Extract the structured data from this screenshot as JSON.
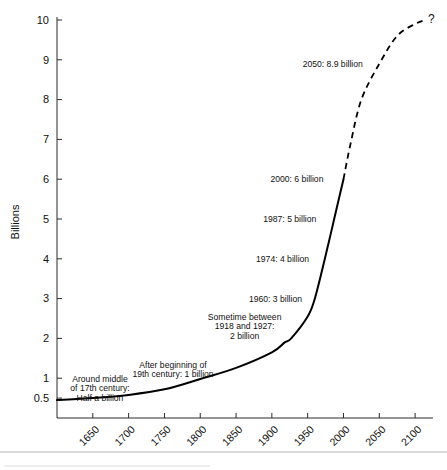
{
  "chart_data": {
    "type": "line",
    "title": "",
    "xlabel": "",
    "ylabel": "Billions",
    "xlim": [
      1600,
      2125
    ],
    "ylim": [
      0,
      10
    ],
    "grid": false,
    "legend": "none",
    "x_ticks": [
      "1650",
      "1700",
      "1750",
      "1800",
      "1850",
      "1900",
      "1950",
      "2000",
      "2050",
      "2100"
    ],
    "y_ticks": [
      "0.5",
      "1",
      "2",
      "3",
      "4",
      "5",
      "6",
      "7",
      "8",
      "9",
      "10"
    ],
    "series": [
      {
        "name": "World population (historical)",
        "style": "solid",
        "x": [
          1600,
          1650,
          1700,
          1750,
          1800,
          1850,
          1900,
          1918,
          1927,
          1950,
          1960,
          1974,
          1987,
          2000
        ],
        "values": [
          0.45,
          0.5,
          0.58,
          0.72,
          0.98,
          1.26,
          1.65,
          1.9,
          2.0,
          2.55,
          3.0,
          4.0,
          5.0,
          6.0
        ]
      },
      {
        "name": "World population (projected)",
        "style": "dashed",
        "x": [
          2000,
          2010,
          2025,
          2050,
          2075,
          2100,
          2115
        ],
        "values": [
          6.0,
          6.9,
          8.0,
          8.9,
          9.6,
          9.9,
          10.0
        ]
      }
    ],
    "annotations": [
      {
        "id": "half-billion",
        "lines": [
          "Around middle",
          "of 17th century:",
          "Half a billion"
        ],
        "x": 1660,
        "y": 0.75
      },
      {
        "id": "one-billion",
        "lines": [
          "After beginning of",
          "19th century: 1 billion"
        ],
        "x": 1762,
        "y": 1.22
      },
      {
        "id": "two-billion",
        "lines": [
          "Sometime between",
          "1918 and 1927:",
          "2 billion"
        ],
        "x": 1862,
        "y": 2.3
      },
      {
        "id": "three-billion",
        "lines": [
          "1960: 3 billion"
        ],
        "x": 1905,
        "y": 3.0
      },
      {
        "id": "four-billion",
        "lines": [
          "1974: 4 billion"
        ],
        "x": 1915,
        "y": 4.0
      },
      {
        "id": "five-billion",
        "lines": [
          "1987: 5 billion"
        ],
        "x": 1925,
        "y": 5.0
      },
      {
        "id": "six-billion",
        "lines": [
          "2000: 6 billion"
        ],
        "x": 1935,
        "y": 6.0
      },
      {
        "id": "nine-billion",
        "lines": [
          "2050: 8.9 billion"
        ],
        "x": 1985,
        "y": 8.9
      },
      {
        "id": "question-mark",
        "lines": [
          "?"
        ],
        "x": 2118,
        "y": 10.0
      }
    ]
  },
  "colors": {
    "curve": "#000000",
    "axis": "#2b2b2b",
    "text": "#111111",
    "background": "#ffffff",
    "footer_rule": "#b4b4b4"
  }
}
